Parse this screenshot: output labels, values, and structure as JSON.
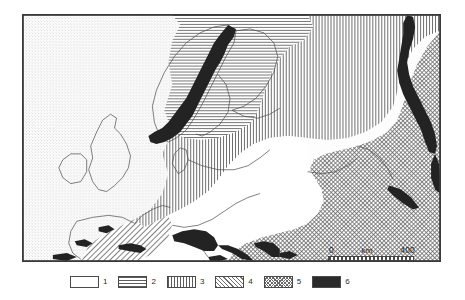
{
  "figure": {
    "type": "thematic-map",
    "region": "Europe",
    "style": "scanned grayscale line map",
    "frame": {
      "visible": true,
      "border_color": "#3a3a3a"
    },
    "background_color": "#ffffff"
  },
  "scale": {
    "zero_label": "0",
    "unit_label": "km",
    "max_label": "400",
    "bar_style": "alternating ticks"
  },
  "legend": {
    "items": [
      {
        "id": 1,
        "label": "1",
        "pattern": "light-stipple",
        "swatch_class": "sw-1",
        "ink": "#8d8d8d"
      },
      {
        "id": 2,
        "label": "2",
        "pattern": "horizontal-lines",
        "swatch_class": "sw-2",
        "ink": "#5c5c5c"
      },
      {
        "id": 3,
        "label": "3",
        "pattern": "vertical-lines",
        "swatch_class": "sw-3",
        "ink": "#5c5c5c"
      },
      {
        "id": 4,
        "label": "4",
        "pattern": "diagonal-hatch",
        "swatch_class": "sw-4",
        "ink": "#6f6f6f"
      },
      {
        "id": 5,
        "label": "5",
        "pattern": "dense-cross-hatch",
        "swatch_class": "sw-5",
        "ink": "#6a6a6a"
      },
      {
        "id": 6,
        "label": "6",
        "pattern": "solid-black",
        "swatch_class": "sw-6",
        "ink": "#2a2a2a"
      }
    ]
  },
  "map_areas": [
    {
      "name": "atlantic-and-western-margin",
      "legend_id": 1,
      "pattern": "light-stipple"
    },
    {
      "name": "northern-baltic-and-finland",
      "legend_id": 2,
      "pattern": "horizontal-lines"
    },
    {
      "name": "central-and-eastern-europe",
      "legend_id": 3,
      "pattern": "vertical-lines"
    },
    {
      "name": "southwestern-france-iberia-margin",
      "legend_id": 4,
      "pattern": "diagonal-hatch"
    },
    {
      "name": "southeastern-europe-pontic",
      "legend_id": 5,
      "pattern": "dense-cross-hatch"
    },
    {
      "name": "mountain-ranges",
      "legend_id": 6,
      "pattern": "solid-black"
    }
  ],
  "mountain_ranges": [
    {
      "name": "scandinavian-mountains"
    },
    {
      "name": "ural-mountains"
    },
    {
      "name": "alps"
    },
    {
      "name": "carpathians"
    },
    {
      "name": "pyrenees"
    },
    {
      "name": "balkan-ranges"
    }
  ]
}
